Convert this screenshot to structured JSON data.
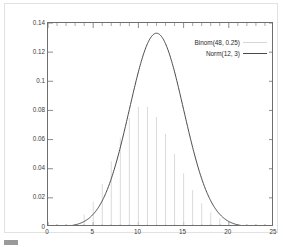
{
  "chart_data": {
    "type": "line",
    "title": "",
    "xlabel": "",
    "ylabel": "",
    "xlim": [
      0,
      25
    ],
    "ylim": [
      0,
      0.14
    ],
    "grid": false,
    "legend_position": "top-right",
    "xticks": [
      0,
      5,
      10,
      15,
      20,
      25
    ],
    "xtick_labels": [
      "0",
      "5",
      "10",
      "15",
      "20",
      "25"
    ],
    "xminor_tick_step": 1,
    "yticks": [
      0,
      0.02,
      0.04,
      0.06,
      0.08,
      0.1,
      0.12,
      0.14
    ],
    "ytick_labels": [
      "0",
      "0.02",
      "0.04",
      "0.06",
      "0.08",
      "0.1",
      "0.12",
      "0.14"
    ],
    "legend": [
      {
        "name": "Binom(48, 0.25)",
        "style": "impulses",
        "color": "#d6d6d6"
      },
      {
        "name": "Norm(12, 3)",
        "style": "line",
        "color": "#4a4a4a"
      }
    ],
    "series": [
      {
        "name": "Binom(48, 0.25)",
        "type": "impulses",
        "color": "#d6d6d6",
        "x": [
          4,
          5,
          6,
          7,
          8,
          9,
          10,
          11,
          12,
          13,
          14,
          15,
          16,
          17,
          18,
          19,
          20
        ],
        "values": [
          0.0086,
          0.0172,
          0.0296,
          0.0451,
          0.0613,
          0.0749,
          0.0824,
          0.0824,
          0.0755,
          0.0639,
          0.0502,
          0.0368,
          0.0253,
          0.0164,
          0.01,
          0.0058,
          0.0032
        ]
      },
      {
        "name": "Norm(12, 3)",
        "type": "line",
        "color": "#4a4a4a",
        "mean": 12,
        "sd": 3,
        "peak_value": 0.133,
        "peak_x": 12
      }
    ]
  },
  "legend": {
    "binom_label": "Binom(48, 0.25)",
    "norm_label": "Norm(12, 3)"
  },
  "bottom_sliver": {
    "text": ""
  }
}
